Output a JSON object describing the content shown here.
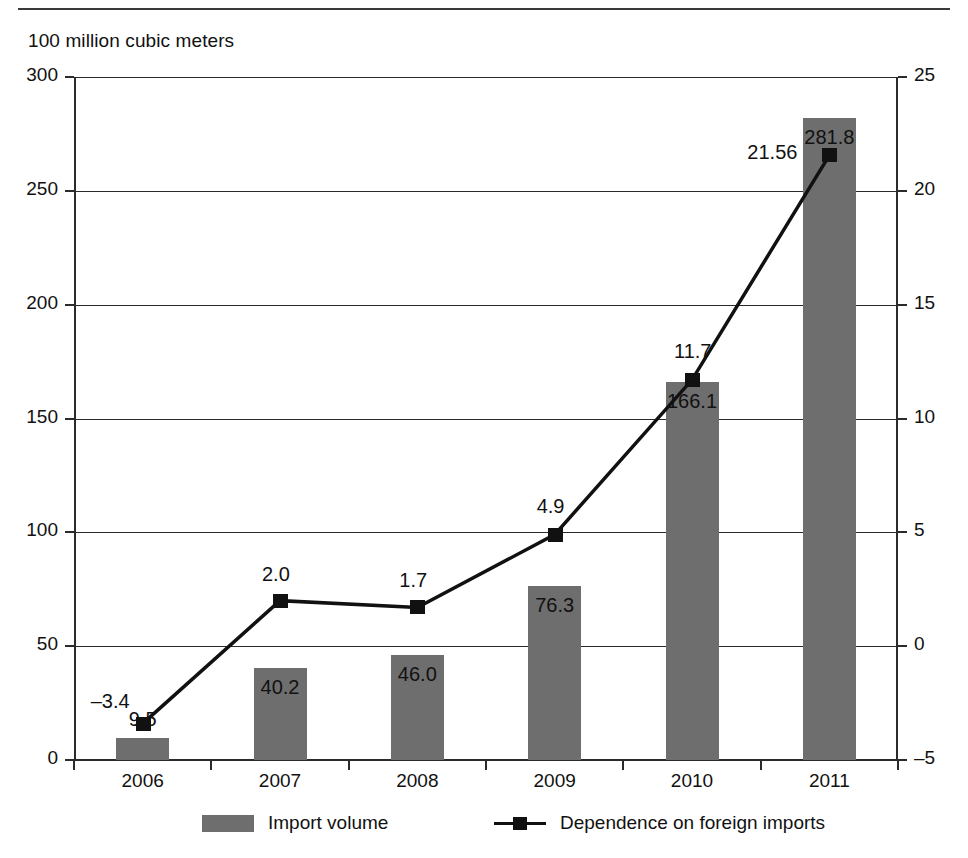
{
  "figure": {
    "unit_label": "100 million cubic meters"
  },
  "legend": {
    "items": [
      {
        "label": "Import volume",
        "marker": "bar-swatch-icon",
        "color": "#6e6e6e"
      },
      {
        "label": "Dependence on foreign imports",
        "marker": "line-marker-icon",
        "color": "#111111"
      }
    ]
  },
  "chart_data": {
    "type": "bar",
    "title": "",
    "subtitle": "",
    "xlabel": "",
    "ylabel": "100 million cubic meters",
    "y2label": "",
    "categories": [
      "2006",
      "2007",
      "2008",
      "2009",
      "2010",
      "2011"
    ],
    "ylim": [
      0,
      300
    ],
    "yticks": [
      0,
      50,
      100,
      150,
      200,
      250,
      300
    ],
    "ytick_labels": [
      "0",
      "50",
      "100",
      "150",
      "200",
      "250",
      "300"
    ],
    "y2lim": [
      -5,
      25
    ],
    "y2ticks": [
      -5,
      0,
      5,
      10,
      15,
      20,
      25
    ],
    "y2tick_labels": [
      "–5",
      "0",
      "5",
      "10",
      "15",
      "20",
      "25"
    ],
    "grid": true,
    "legend_position": "bottom",
    "series": [
      {
        "name": "Import volume",
        "type": "bar",
        "axis": "left",
        "color": "#6e6e6e",
        "values": [
          9.5,
          40.2,
          46.0,
          76.3,
          166.1,
          281.8
        ],
        "labels": [
          "9.5",
          "40.2",
          "46.0",
          "76.3",
          "166.1",
          "281.8"
        ]
      },
      {
        "name": "Dependence on foreign imports",
        "type": "line",
        "axis": "right",
        "color": "#111111",
        "values": [
          -3.4,
          2.0,
          1.7,
          4.9,
          11.7,
          21.56
        ],
        "labels": [
          "–3.4",
          "2.0",
          "1.7",
          "4.9",
          "11.7",
          "21.56"
        ]
      }
    ]
  }
}
